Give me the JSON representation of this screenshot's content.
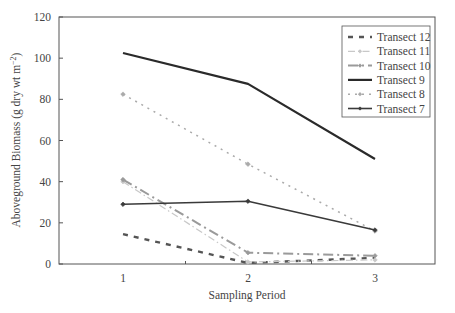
{
  "chart_data": {
    "type": "line",
    "title": "",
    "xlabel": "Sampling Period",
    "ylabel": "Aboveground Biomass (g dry wt m^-2)",
    "ylabel_main": "Aboveground Biomass (g dry wt m",
    "ylabel_sup": "−2",
    "ylabel_close": ")",
    "x": [
      1,
      2,
      3
    ],
    "x_tick_labels": [
      "1",
      "2",
      "3"
    ],
    "y_ticks": [
      0,
      20,
      40,
      60,
      80,
      100,
      120
    ],
    "ylim": [
      0,
      120
    ],
    "grid": false,
    "legend_position": "upper right",
    "series": [
      {
        "name": "Transect 12",
        "values": [
          14.5,
          0.5,
          3
        ],
        "color": "#555555",
        "style": "dashed-bold",
        "marker": "none"
      },
      {
        "name": "Transect 11",
        "values": [
          40,
          1,
          2
        ],
        "color": "#c8c8c8",
        "style": "dash-dot-light",
        "marker": "diamond"
      },
      {
        "name": "Transect 10",
        "values": [
          41,
          5.5,
          4
        ],
        "color": "#9a9a9a",
        "style": "dash-dot",
        "marker": "diamond"
      },
      {
        "name": "Transect 9",
        "values": [
          102.5,
          87.5,
          51
        ],
        "color": "#2a2a2a",
        "style": "solid-bold",
        "marker": "none"
      },
      {
        "name": "Transect 8",
        "values": [
          82.5,
          48.5,
          16
        ],
        "color": "#aaaaaa",
        "style": "dotted",
        "marker": "diamond"
      },
      {
        "name": "Transect 7",
        "values": [
          29,
          30.5,
          16.5
        ],
        "color": "#3a3a3a",
        "style": "solid",
        "marker": "diamond"
      }
    ]
  }
}
